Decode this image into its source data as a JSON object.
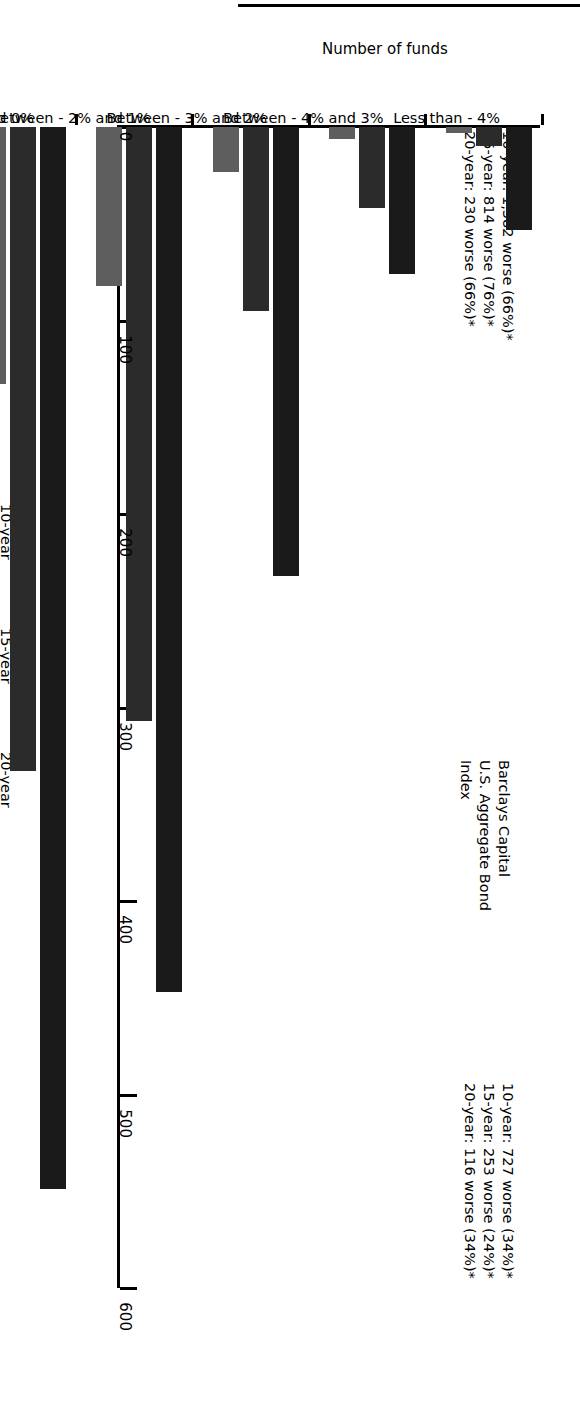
{
  "chart_data": {
    "type": "bar",
    "orientation": "horizontal",
    "title": "",
    "xlabel": "Number of funds",
    "ylabel": "",
    "xlim": [
      0,
      600
    ],
    "xticks": [
      0,
      100,
      200,
      300,
      400,
      500,
      600
    ],
    "xtick_labels": [
      "0",
      "100",
      "200",
      "300",
      "400",
      "500",
      "600"
    ],
    "grid": false,
    "legend_position": "left",
    "categories": [
      "Less than - 4%",
      "Between - 4% and 3%",
      "Between - 3% and 2%",
      "Between - 2% and 1%",
      "Between - 1% and 0%",
      "Between - 0% and 1%",
      "Between - 1% and 2%",
      "Between - 2% and 3%",
      "Between - 3% and 4%",
      "Greater than 4%"
    ],
    "series": [
      {
        "name": "10-year",
        "color": "#1a1a1a",
        "values": [
          53,
          76,
          232,
          447,
          549,
          327,
          229,
          110,
          50,
          48
        ]
      },
      {
        "name": "15-year",
        "color": "#2b2b2b",
        "values": [
          10,
          42,
          95,
          307,
          333,
          156,
          78,
          196,
          16,
          22
        ]
      },
      {
        "name": "20-year",
        "color": "#5e5e5e",
        "values": [
          3,
          6,
          23,
          82,
          133,
          36,
          51,
          82,
          6,
          2
        ]
      }
    ],
    "annotations": [
      {
        "id": "worse-than-benchmark",
        "lines": [
          "10-year: 1,382 worse (66%)*",
          "15-year: 814 worse (76%)*",
          "20-year: 230 worse (66%)*"
        ]
      },
      {
        "id": "better-than-benchmark",
        "lines": [
          "10-year: 727 worse (34%)*",
          "15-year: 253 worse (24%)*",
          "20-year: 116 worse (34%)*"
        ]
      }
    ],
    "benchmark": {
      "lines": [
        "Barclays Capital",
        "U.S. Aggregate Bond",
        "Index"
      ],
      "style": "dashed-with-arrow"
    }
  },
  "legend": {
    "items": [
      {
        "label": "10-year",
        "color": "#1a1a1a"
      },
      {
        "label": "15-year",
        "color": "#2b2b2b"
      },
      {
        "label": "20-year",
        "color": "#5e5e5e"
      }
    ]
  }
}
